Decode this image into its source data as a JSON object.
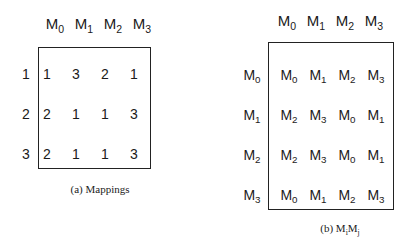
{
  "panel_a": {
    "columns": [
      "M0",
      "M1",
      "M2",
      "M3"
    ],
    "rows": [
      {
        "label": "1",
        "values": [
          "1",
          "3",
          "2",
          "1"
        ]
      },
      {
        "label": "2",
        "values": [
          "2",
          "1",
          "1",
          "3"
        ]
      },
      {
        "label": "3",
        "values": [
          "2",
          "1",
          "1",
          "3"
        ]
      }
    ],
    "caption": "(a) Mappings"
  },
  "panel_b": {
    "columns": [
      "M0",
      "M1",
      "M2",
      "M3"
    ],
    "rows": [
      {
        "label": "M0",
        "values": [
          "M0",
          "M1",
          "M2",
          "M3"
        ]
      },
      {
        "label": "M1",
        "values": [
          "M2",
          "M3",
          "M0",
          "M1"
        ]
      },
      {
        "label": "M2",
        "values": [
          "M2",
          "M3",
          "M0",
          "M1"
        ]
      },
      {
        "label": "M3",
        "values": [
          "M0",
          "M1",
          "M2",
          "M3"
        ]
      }
    ],
    "caption_prefix": "(b)",
    "caption_formula": "MiMj"
  }
}
